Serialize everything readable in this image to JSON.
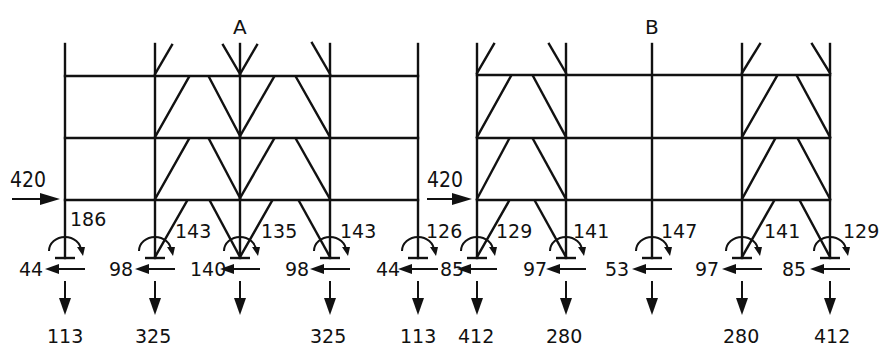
{
  "frames": [
    {
      "id": "A",
      "title": "A",
      "lateral_load": "420",
      "columns": [
        {
          "moment": "186",
          "horizontal": "44",
          "vertical": "113"
        },
        {
          "moment": "143",
          "horizontal": "98",
          "vertical": "325"
        },
        {
          "moment": "135",
          "horizontal": "140",
          "vertical": ""
        },
        {
          "moment": "143",
          "horizontal": "98",
          "vertical": "325"
        },
        {
          "moment": "126",
          "horizontal": "44",
          "vertical": "113"
        }
      ]
    },
    {
      "id": "B",
      "title": "B",
      "lateral_load": "420",
      "columns": [
        {
          "moment": "129",
          "horizontal": "85",
          "vertical": "412"
        },
        {
          "moment": "141",
          "horizontal": "97",
          "vertical": "280"
        },
        {
          "moment": "147",
          "horizontal": "53",
          "vertical": ""
        },
        {
          "moment": "141",
          "horizontal": "97",
          "vertical": "280"
        },
        {
          "moment": "129",
          "horizontal": "85",
          "vertical": "412"
        }
      ]
    }
  ]
}
